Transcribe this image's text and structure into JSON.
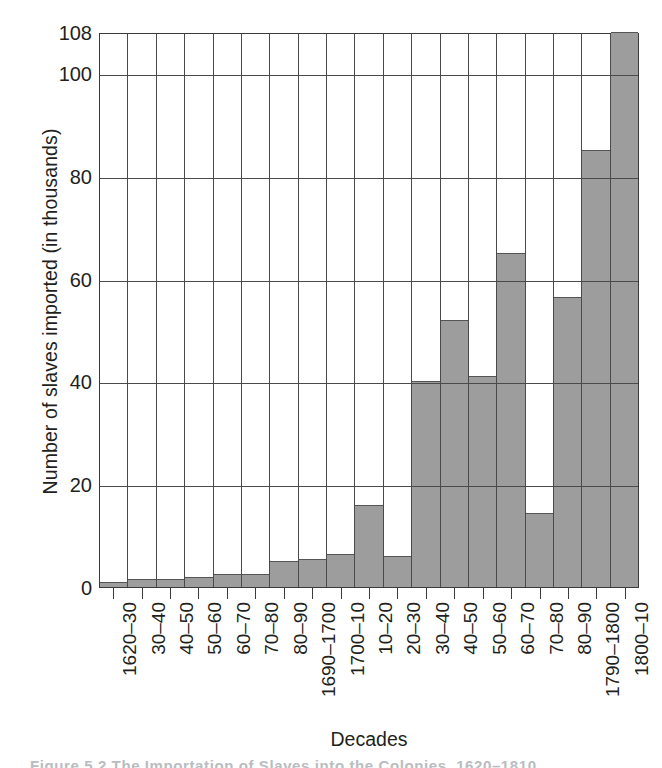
{
  "chart_data": {
    "type": "bar",
    "title": "",
    "xlabel": "Decades",
    "ylabel": "Number of slaves imported (in thousands)",
    "ylim": [
      0,
      108
    ],
    "yticks": [
      0,
      20,
      40,
      60,
      80,
      100,
      108
    ],
    "ytick_labels": [
      "0",
      "20",
      "40",
      "60",
      "80",
      "100",
      "108"
    ],
    "grid": "horizontal-and-vertical",
    "legend": "none",
    "bar_color": "#9d9d9d",
    "bar_edge_color": "#555555",
    "axis_color": "#3b3b3b",
    "categories": [
      "1620–30",
      "30–40",
      "40–50",
      "50–60",
      "60–70",
      "70–80",
      "80–90",
      "1690–1700",
      "1700–10",
      "10–20",
      "20–30",
      "30–40",
      "40–50",
      "50–60",
      "60–70",
      "70–80",
      "80–90",
      "1790–1800",
      "1800–10"
    ],
    "values": [
      1,
      1.5,
      1.5,
      2,
      2.5,
      2.5,
      5,
      5.5,
      6.5,
      16,
      6,
      40,
      52,
      41,
      65,
      14.5,
      56.5,
      85,
      108
    ]
  },
  "caption": {
    "text": "Figure 5.2   The Importation of Slaves into the Colonies, 1620–1810"
  }
}
